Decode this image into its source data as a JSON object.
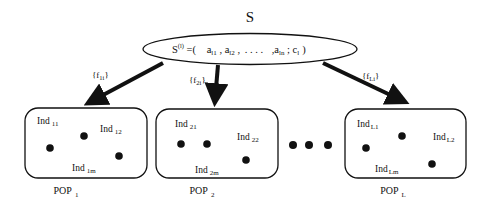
{
  "diagram": {
    "root": {
      "title": "S",
      "formula": {
        "lhs": "S",
        "lhs_sup": "(l)",
        "eq": " =(",
        "items": [
          {
            "base": "a",
            "sub": "l1"
          },
          {
            "base": "a",
            "sub": "l2"
          },
          {
            "sep": ". . . ."
          },
          {
            "base": "a",
            "sub": "ln"
          },
          {
            "base": "c",
            "sub": "l"
          }
        ],
        "close": ")"
      }
    },
    "arrows": [
      {
        "label_prefix": "{f",
        "label_sub": "1i",
        "label_suffix": "}"
      },
      {
        "label_prefix": "{f",
        "label_sub": "2i",
        "label_suffix": "}"
      },
      {
        "label_prefix": "{f",
        "label_sub": "Li",
        "label_suffix": "}"
      }
    ],
    "populations": [
      {
        "label": "POP",
        "label_sub": "1",
        "individuals": [
          {
            "label": "Ind",
            "sub": "11"
          },
          {
            "label": "Ind",
            "sub": "12"
          },
          {
            "label": "Ind",
            "sub": "1m"
          }
        ]
      },
      {
        "label": "POP",
        "label_sub": "2",
        "individuals": [
          {
            "label": "Ind",
            "sub": "21"
          },
          {
            "label": "Ind",
            "sub": "22"
          },
          {
            "label": "Ind",
            "sub": "2m"
          }
        ]
      },
      {
        "label": "POP",
        "label_sub": "L",
        "individuals": [
          {
            "label": "Ind",
            "sub": "L1"
          },
          {
            "label": "Ind",
            "sub": "L2"
          },
          {
            "label": "Ind",
            "sub": "Lm"
          }
        ]
      }
    ],
    "ellipsis": "• • •"
  }
}
